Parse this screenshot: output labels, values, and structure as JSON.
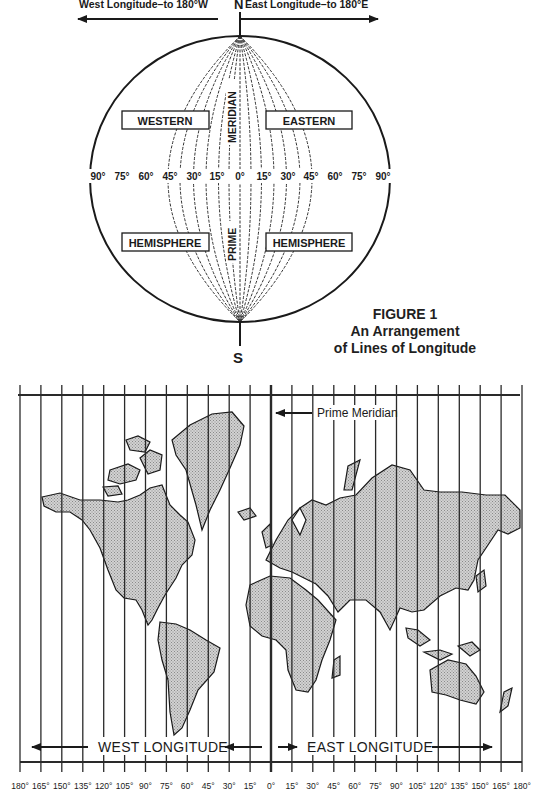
{
  "figure": {
    "number_label": "FIGURE 1",
    "caption_line1": "An Arrangement",
    "caption_line2": "of Lines of Longitude"
  },
  "globe": {
    "north_label": "N",
    "south_label": "S",
    "west_arrow_label": "West Longitude–to 180°W",
    "east_arrow_label": "East Longitude–to 180°E",
    "western_label": "WESTERN",
    "eastern_label": "EASTERN",
    "hemisphere_left_label": "HEMISPHERE",
    "hemisphere_right_label": "HEMISPHERE",
    "meridian_label": "MERIDIAN",
    "prime_label": "PRIME",
    "degree_labels": [
      "90°",
      "75°",
      "60°",
      "45°",
      "30°",
      "15°",
      "0°",
      "15°",
      "30°",
      "45°",
      "60°",
      "75°",
      "90°"
    ]
  },
  "map": {
    "prime_meridian_label": "Prime Meridian",
    "west_longitude_label": "WEST LONGITUDE",
    "east_longitude_label": "EAST LONGITUDE",
    "degree_labels": [
      "180°",
      "165°",
      "150°",
      "135°",
      "120°",
      "105°",
      "90°",
      "75°",
      "60°",
      "45°",
      "30°",
      "15°",
      "0°",
      "15°",
      "30°",
      "45°",
      "60°",
      "75°",
      "90°",
      "105°",
      "120°",
      "135°",
      "150°",
      "165°",
      "180°"
    ],
    "land_color": "#c8c8c8",
    "line_color": "#2a2a2a"
  }
}
